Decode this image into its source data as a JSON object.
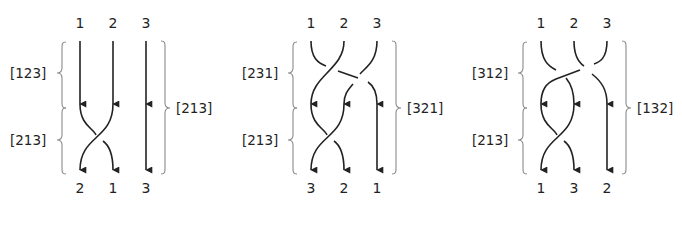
{
  "panels": [
    {
      "top_labels": [
        "1",
        "2",
        "3"
      ],
      "bottom_labels": [
        "2",
        "1",
        "3"
      ],
      "left_upper_label": "[123]",
      "left_lower_label": "[213]",
      "right_label": "[213]"
    },
    {
      "top_labels": [
        "1",
        "2",
        "3"
      ],
      "bottom_labels": [
        "3",
        "2",
        "1"
      ],
      "left_upper_label": "[231]",
      "left_lower_label": "[213]",
      "right_label": "[321]"
    },
    {
      "top_labels": [
        "1",
        "2",
        "3"
      ],
      "bottom_labels": [
        "1",
        "3",
        "2"
      ],
      "left_upper_label": "[312]",
      "left_lower_label": "[213]",
      "right_label": "[132]"
    }
  ],
  "colors": {
    "strand": "#222222",
    "brace": "#8a8a8a",
    "background": "#ffffff"
  }
}
